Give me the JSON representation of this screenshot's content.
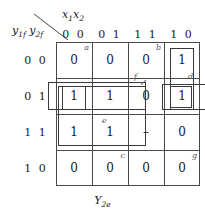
{
  "diagram": {
    "kind": "karnaugh-map",
    "caption": "Y2e",
    "caption_base": "Y",
    "caption_sub": "2e",
    "column_variable": "x1x2",
    "column_variable_base_1": "x",
    "column_variable_sub_1": "1",
    "column_variable_base_2": "x",
    "column_variable_sub_2": "2",
    "row_variable": "y1f y2f",
    "row_variable_base_1": "y",
    "row_variable_sub_1": "1f",
    "row_variable_base_2": "y",
    "row_variable_sub_2": "2f",
    "column_headers": [
      "0 0",
      "0 1",
      "1 1",
      "1 0"
    ],
    "row_headers": [
      "0 0",
      "0 1",
      "1 1",
      "1 0"
    ],
    "cells": [
      [
        {
          "value": "0",
          "tag": "a",
          "tag_faint": false
        },
        {
          "value": "0",
          "tag": "",
          "tag_faint": true
        },
        {
          "value": "0",
          "tag": "b",
          "tag_faint": false
        },
        {
          "value": "1",
          "tag": "",
          "tag_faint": false
        }
      ],
      [
        {
          "value": "1",
          "tag": "",
          "tag_faint": false
        },
        {
          "value": "1",
          "tag": "",
          "tag_faint": false
        },
        {
          "value": "0",
          "tag": "",
          "tag_faint": false
        },
        {
          "value": "1",
          "tag": "",
          "tag_faint": false
        }
      ],
      [
        {
          "value": "1",
          "tag": "",
          "tag_faint": false
        },
        {
          "value": "1",
          "tag": "",
          "tag_faint": false
        },
        {
          "value": "–",
          "tag": "",
          "tag_faint": false
        },
        {
          "value": "0",
          "tag": "",
          "tag_faint": false
        }
      ],
      [
        {
          "value": "0",
          "tag": "",
          "tag_faint": false
        },
        {
          "value": "0",
          "tag": "c",
          "tag_faint": false
        },
        {
          "value": "0",
          "tag": "",
          "tag_faint": false
        },
        {
          "value": "0",
          "tag": "g",
          "tag_faint": false
        }
      ]
    ],
    "group_tags": {
      "e": "e",
      "f": "f",
      "d": "d"
    },
    "colors": {
      "grid_line": "#4a4a4a",
      "group_line": "#3a3a3a",
      "text": "#1a1a1a",
      "tag_text": "#555555",
      "background": "#ffffff"
    }
  }
}
